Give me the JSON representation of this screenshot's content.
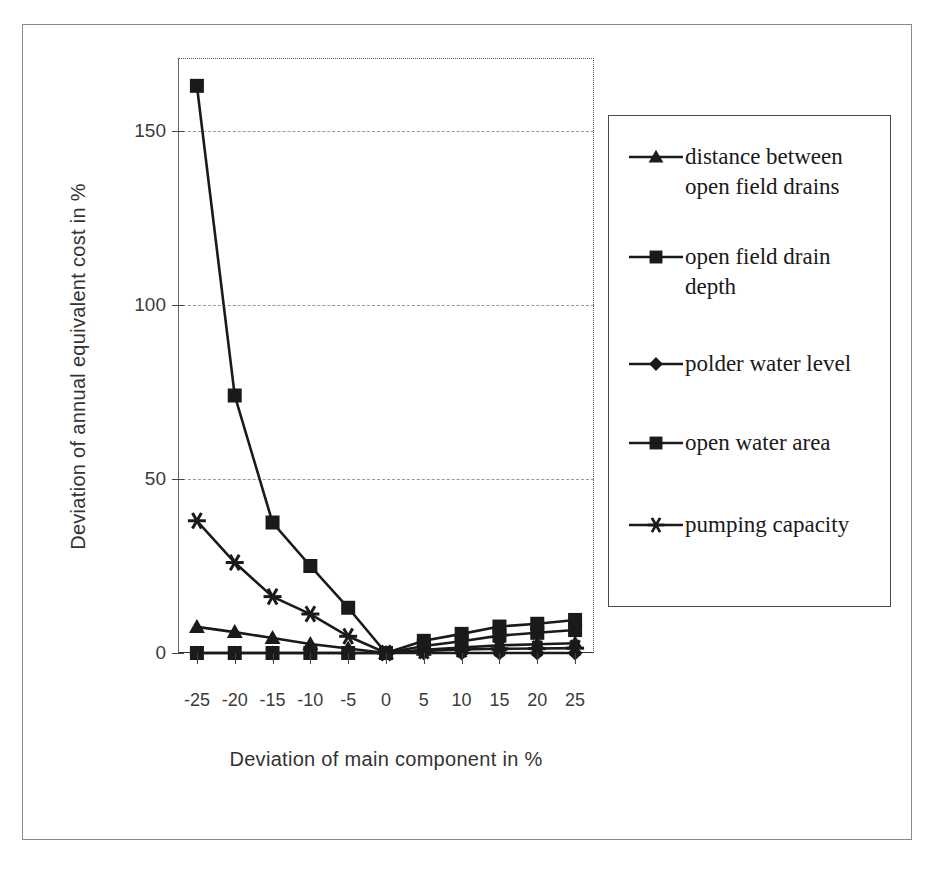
{
  "chart_data": {
    "type": "line",
    "title": "",
    "xlabel": "Deviation of main component in %",
    "ylabel": "Deviation of annual equivalent cost in %",
    "x": [
      -25,
      -20,
      -15,
      -10,
      -5,
      0,
      5,
      10,
      15,
      20,
      25
    ],
    "xtick_labels": [
      "-25",
      "-20",
      "-15",
      "-10",
      "-5",
      "0",
      "5",
      "10",
      "15",
      "20",
      "25"
    ],
    "ytick_labels": [
      "0",
      "50",
      "100",
      "150"
    ],
    "yticks": [
      0,
      50,
      100,
      150
    ],
    "xlim": [
      -27.5,
      27.5
    ],
    "ylim": [
      0,
      171
    ],
    "grid": "horizontal-dashed",
    "legend_position": "right",
    "series": [
      {
        "name": "distance between open field drains",
        "marker": "triangle",
        "values": [
          7.5,
          6.0,
          4.3,
          2.6,
          1.3,
          0.0,
          0.9,
          1.6,
          2.2,
          2.5,
          2.8
        ]
      },
      {
        "name": "open field drain depth",
        "marker": "square",
        "values": [
          163.0,
          74.0,
          37.5,
          25.0,
          13.0,
          0.0,
          3.5,
          5.5,
          7.6,
          8.4,
          9.5
        ]
      },
      {
        "name": "polder water level",
        "marker": "diamond",
        "values": [
          0.0,
          0.0,
          0.0,
          0.0,
          0.0,
          0.0,
          0.0,
          0.0,
          0.0,
          0.0,
          0.0
        ]
      },
      {
        "name": "open water area",
        "marker": "square",
        "values": [
          0.0,
          0.0,
          0.0,
          0.0,
          0.0,
          0.0,
          2.0,
          3.4,
          5.0,
          5.8,
          6.6
        ]
      },
      {
        "name": "pumping capacity",
        "marker": "asterisk",
        "values": [
          38.0,
          26.0,
          16.2,
          11.2,
          4.8,
          0.0,
          0.6,
          1.0,
          1.2,
          1.3,
          1.4
        ]
      }
    ]
  },
  "legend": {
    "entries": [
      {
        "label": "distance between\nopen field drains",
        "marker": "triangle",
        "top": 26
      },
      {
        "label": "open field drain\ndepth",
        "marker": "square",
        "top": 126
      },
      {
        "label": "polder water level",
        "marker": "diamond",
        "top": 233
      },
      {
        "label": "open water area",
        "marker": "square",
        "top": 312
      },
      {
        "label": "pumping capacity",
        "marker": "asterisk",
        "top": 394
      }
    ]
  },
  "colors": {
    "ink": "#1a1a1a",
    "grid": "#9a9a9a",
    "frame": "#555555",
    "background": "#ffffff"
  }
}
